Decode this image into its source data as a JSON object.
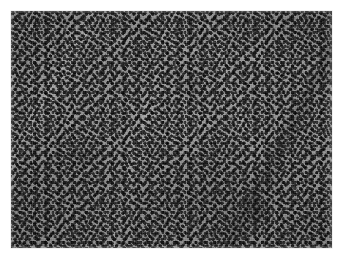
{
  "figure": {
    "kind": "histopathology-micrograph",
    "modality": "light-microscopy",
    "stain_appearance": "grayscale",
    "caption": "",
    "title": "",
    "scale_bar_label": "",
    "magnification_label": "",
    "annotation_text": ""
  },
  "plate": {
    "background_color": "#ffffff",
    "frame_left_px": 11,
    "frame_top_px": 11,
    "frame_width_px": 321,
    "frame_height_px": 237
  },
  "image_content": {
    "description": "Densely cellular tissue composed of closely packed small, round, darkly stained nuclei with scant intervening pale cytoplasm and stroma.",
    "background_tone": "#9e9e9e",
    "nucleus_tone_dark": "#262626",
    "nucleus_tone_mid": "#3a3a3a",
    "pale_stroma_tone": "#e6e6e6",
    "cell_density": "high",
    "nucleus_diameter_px": 4,
    "features": [
      "diffuse sheets of small dark nuclei",
      "pale fibrovascular bands running obliquely",
      "focal darker compact cell clusters",
      "uneven illumination across the field",
      "fine photographic film grain"
    ]
  },
  "regions": [
    {
      "name": "upper-left-field",
      "tone": "lighter",
      "note": "slightly paler, less compact cellularity"
    },
    {
      "name": "upper-right-field",
      "tone": "lighter",
      "note": "pale vertical stromal band"
    },
    {
      "name": "lower-left-field",
      "tone": "darker",
      "note": "oblique pale streak crossing dense nuclei"
    },
    {
      "name": "lower-right-field",
      "tone": "darker",
      "note": "elongated darker vascular structure"
    },
    {
      "name": "central-field",
      "tone": "mid",
      "note": "uniformly dense small round cells"
    }
  ]
}
